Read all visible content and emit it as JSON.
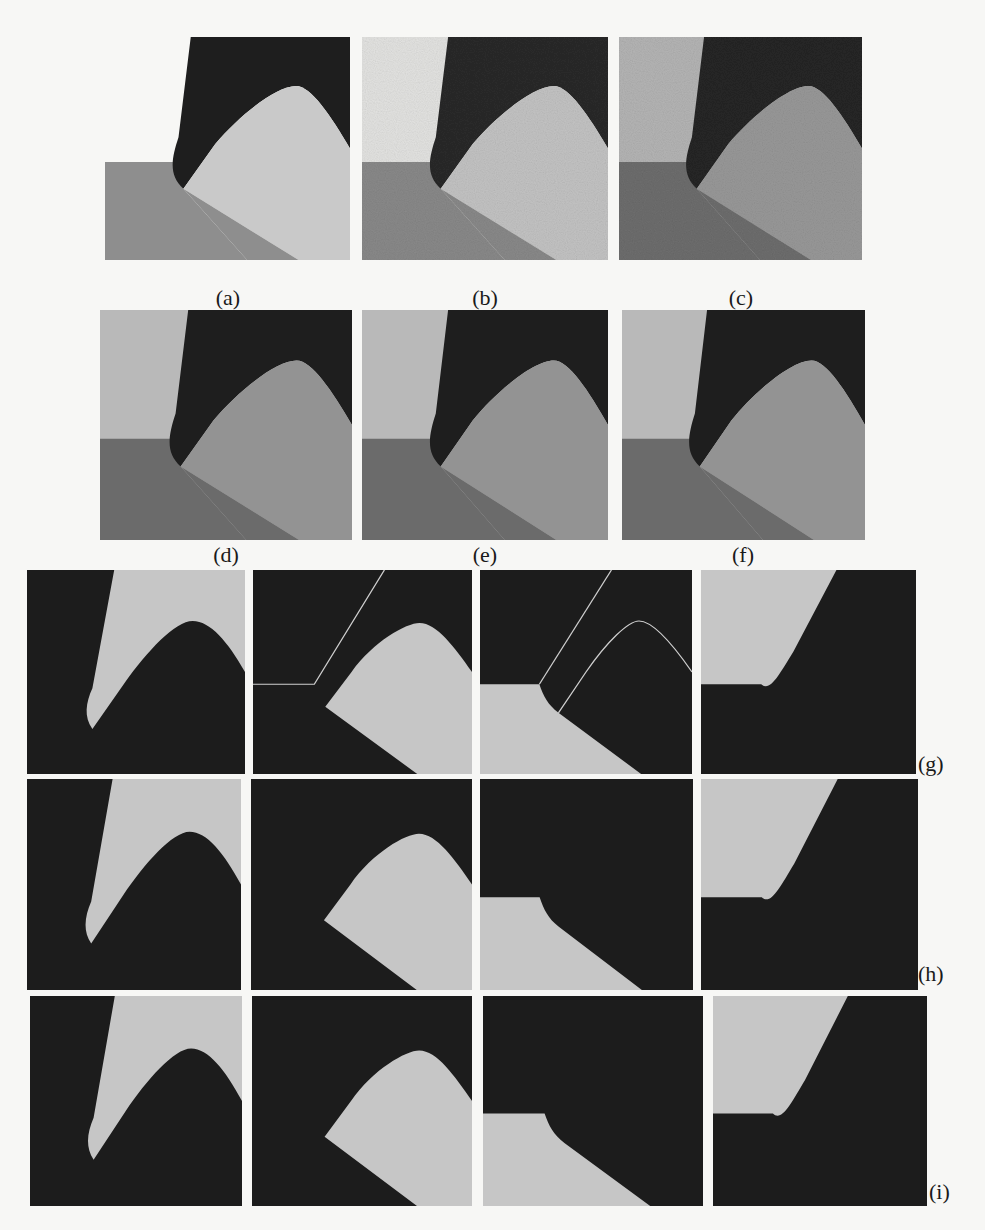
{
  "figure": {
    "colors": {
      "page_bg": "#f7f7f5",
      "dark": "#1e1e1e",
      "light_gray": "#c9c9c9",
      "top_left_region_row1a": "#f7f7f5",
      "top_left_region_noisy": "#bdbdbd",
      "mid_gray": "#8e8e8e",
      "dark_gray": "#6a6a6a",
      "mask_light": "#c6c6c6",
      "mask_dark": "#1c1c1c"
    },
    "row1": {
      "captions": [
        "(a)",
        "(b)",
        "(c)"
      ]
    },
    "row2": {
      "captions": [
        "(d)",
        "(e)",
        "(f)"
      ]
    },
    "mask_rows": [
      {
        "label": "(g)",
        "subpanels": 4
      },
      {
        "label": "(h)",
        "subpanels": 4
      },
      {
        "label": "(i)",
        "subpanels": 4
      }
    ]
  }
}
